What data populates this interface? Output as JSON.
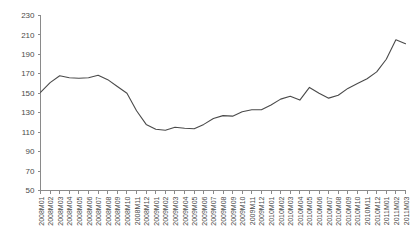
{
  "chart_data": {
    "type": "line",
    "title": "",
    "subtitle": "",
    "xlabel": "",
    "ylabel": "",
    "ylim": [
      50,
      230
    ],
    "ytick_step": 20,
    "yticks": [
      50,
      70,
      90,
      110,
      130,
      150,
      170,
      190,
      210,
      230
    ],
    "grid": false,
    "legend": null,
    "legend_position": "none",
    "annotations": [],
    "categories": [
      "2008M01",
      "2008M02",
      "2008M03",
      "2008M04",
      "2008M05",
      "2008M06",
      "2008M07",
      "2008M08",
      "2008M09",
      "2008M10",
      "2008M11",
      "2008M12",
      "2009M01",
      "2009M02",
      "2009M03",
      "2009M04",
      "2009M05",
      "2009M06",
      "2009M07",
      "2009M08",
      "2009M09",
      "2009M10",
      "2009M11",
      "2009M12",
      "2010M01",
      "2010M02",
      "2010M03",
      "2010M04",
      "2010M05",
      "2010M06",
      "2010M07",
      "2010M08",
      "2010M09",
      "2010M10",
      "2010M11",
      "2010M12",
      "2011M01",
      "2011M02",
      "2011M03"
    ],
    "values": [
      151,
      161,
      168,
      166,
      165.5,
      166,
      168.5,
      164,
      157,
      150,
      132,
      118,
      113,
      112,
      115,
      114,
      113.5,
      118,
      124,
      127,
      126.5,
      131,
      133,
      133,
      138,
      144,
      147,
      143,
      156,
      150,
      145,
      148,
      155,
      160,
      165,
      172,
      185,
      205,
      201
    ],
    "series_name": "",
    "line_color": "#4a4a4a",
    "axis_color": "#8a8a8a",
    "background_color": "#ffffff"
  }
}
